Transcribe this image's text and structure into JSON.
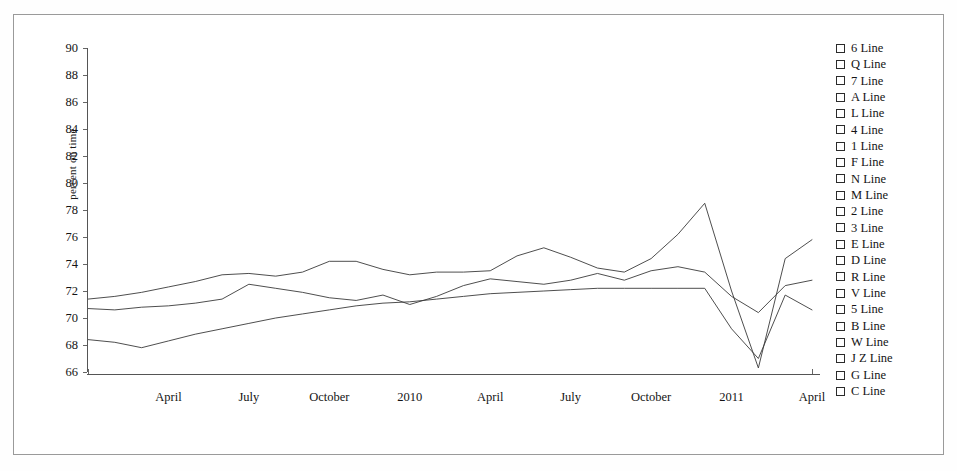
{
  "chart_data": {
    "type": "line",
    "title": "",
    "xlabel": "",
    "ylabel": "percent on time",
    "ylim": [
      66,
      90
    ],
    "y_ticks": [
      90,
      88,
      86,
      84,
      82,
      80,
      78,
      76,
      74,
      72,
      70,
      68,
      66
    ],
    "x_tick_labels": [
      "April",
      "July",
      "October",
      "2010",
      "April",
      "July",
      "October",
      "2011",
      "April"
    ],
    "grid": false,
    "legend_position": "right",
    "x": [
      "2009-01",
      "2009-02",
      "2009-03",
      "2009-04",
      "2009-05",
      "2009-06",
      "2009-07",
      "2009-08",
      "2009-09",
      "2009-10",
      "2009-11",
      "2009-12",
      "2010-01",
      "2010-02",
      "2010-03",
      "2010-04",
      "2010-05",
      "2010-06",
      "2010-07",
      "2010-08",
      "2010-09",
      "2010-10",
      "2010-11",
      "2010-12",
      "2011-01",
      "2011-02",
      "2011-03",
      "2011-04"
    ],
    "series": [
      {
        "name": "upper",
        "values": [
          71.4,
          71.6,
          71.9,
          72.3,
          72.7,
          73.2,
          73.3,
          73.1,
          73.4,
          74.2,
          74.2,
          73.6,
          73.2,
          73.4,
          73.4,
          73.5,
          74.6,
          75.2,
          74.5,
          73.7,
          73.4,
          74.4,
          76.2,
          78.5,
          72.0,
          66.3,
          74.4,
          75.8
        ]
      },
      {
        "name": "middle",
        "values": [
          70.7,
          70.6,
          70.8,
          70.9,
          71.1,
          71.4,
          72.5,
          72.2,
          71.9,
          71.5,
          71.3,
          71.7,
          71.0,
          71.6,
          72.4,
          72.9,
          72.7,
          72.5,
          72.8,
          73.3,
          72.8,
          73.5,
          73.8,
          73.4,
          71.6,
          70.4,
          72.4,
          72.8
        ]
      },
      {
        "name": "lower",
        "values": [
          68.4,
          68.2,
          67.8,
          68.3,
          68.8,
          69.2,
          69.6,
          70.0,
          70.3,
          70.6,
          70.9,
          71.1,
          71.2,
          71.4,
          71.6,
          71.8,
          71.9,
          72.0,
          72.1,
          72.2,
          72.2,
          72.2,
          72.2,
          72.2,
          69.2,
          67.0,
          71.7,
          70.6
        ]
      }
    ]
  },
  "legend": {
    "items": [
      {
        "label": "6 Line"
      },
      {
        "label": "Q Line"
      },
      {
        "label": "7 Line"
      },
      {
        "label": "A Line"
      },
      {
        "label": "L Line"
      },
      {
        "label": "4 Line"
      },
      {
        "label": "1 Line"
      },
      {
        "label": "F Line"
      },
      {
        "label": "N Line"
      },
      {
        "label": "M Line"
      },
      {
        "label": "2 Line"
      },
      {
        "label": "3 Line"
      },
      {
        "label": "E Line"
      },
      {
        "label": "D Line"
      },
      {
        "label": "R Line"
      },
      {
        "label": "V Line"
      },
      {
        "label": "5 Line"
      },
      {
        "label": "B Line"
      },
      {
        "label": "W Line"
      },
      {
        "label": "J Z Line"
      },
      {
        "label": "G Line"
      },
      {
        "label": "C Line"
      }
    ]
  },
  "colors": {
    "line": "#3a3a3a",
    "axis": "#555555",
    "text": "#141414",
    "frame": "#9a9a9a",
    "background": "#ffffff"
  }
}
